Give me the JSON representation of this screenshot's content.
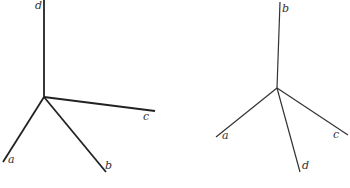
{
  "figures": [
    {
      "name": "left-axes",
      "origin": [
        44,
        97
      ],
      "axes": [
        {
          "label": "d",
          "end": [
            44,
            0
          ],
          "width": 1.8,
          "label_pos": [
            35,
            9
          ]
        },
        {
          "label": "c",
          "end": [
            155,
            111
          ],
          "width": 1.8,
          "label_pos": [
            143,
            120
          ]
        },
        {
          "label": "a",
          "end": [
            3,
            162
          ],
          "width": 1.8,
          "label_pos": [
            8,
            163
          ]
        },
        {
          "label": "b",
          "end": [
            106,
            172
          ],
          "width": 1.8,
          "label_pos": [
            105,
            169
          ]
        }
      ]
    },
    {
      "name": "right-axes",
      "origin": [
        277,
        88
      ],
      "axes": [
        {
          "label": "b",
          "end": [
            280,
            2
          ],
          "width": 1.2,
          "label_pos": [
            282,
            12
          ]
        },
        {
          "label": "a",
          "end": [
            216,
            137
          ],
          "width": 1.2,
          "label_pos": [
            222,
            139
          ]
        },
        {
          "label": "c",
          "end": [
            348,
            135
          ],
          "width": 1.2,
          "label_pos": [
            333,
            138
          ]
        },
        {
          "label": "d",
          "end": [
            300,
            172
          ],
          "width": 1.2,
          "label_pos": [
            302,
            169
          ]
        }
      ]
    }
  ]
}
